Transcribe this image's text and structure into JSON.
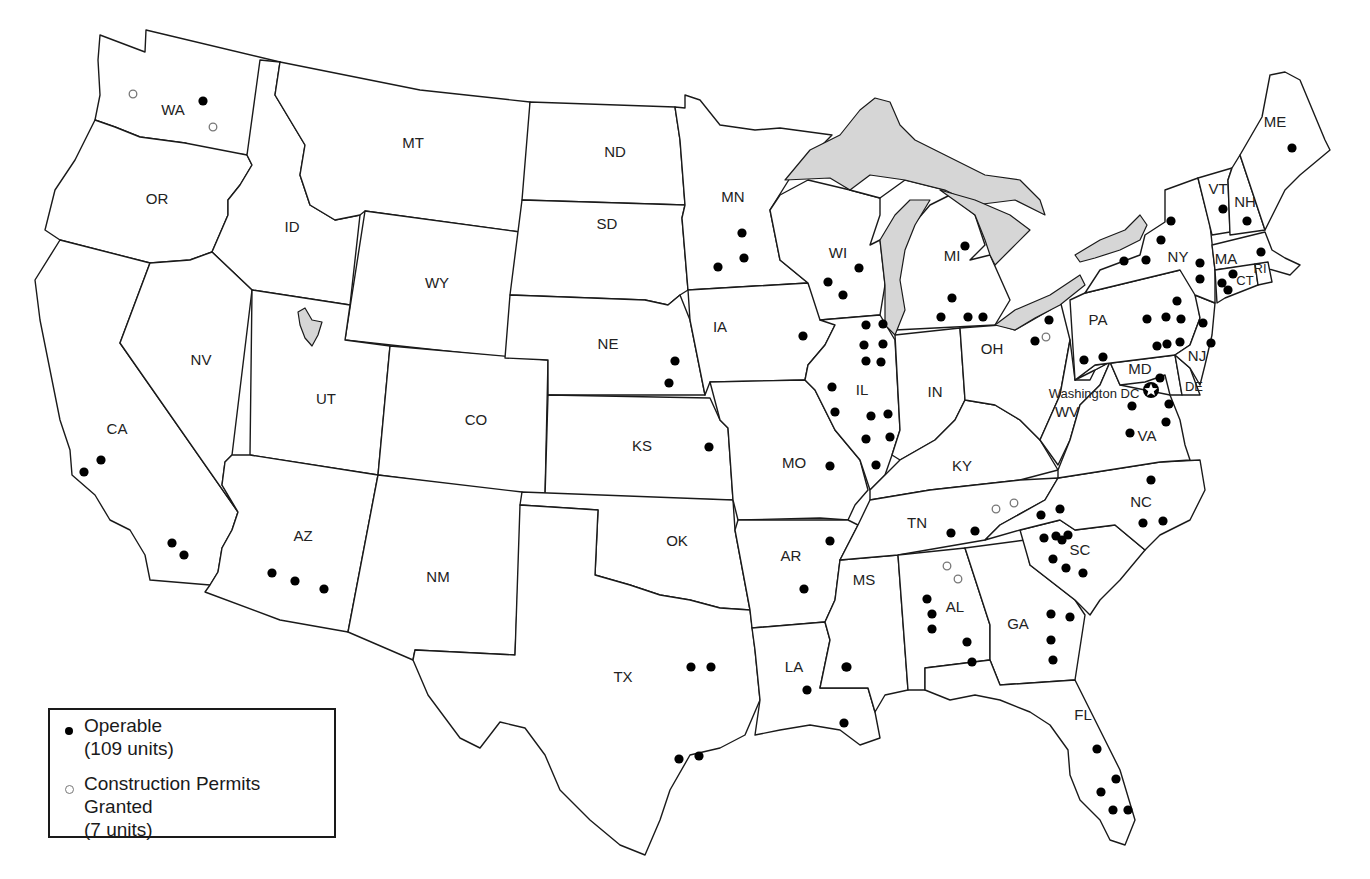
{
  "legend": {
    "operable": {
      "label": "Operable",
      "count": "(109 units)"
    },
    "construction": {
      "label": "Construction Permits Granted",
      "count": "(7 units)"
    }
  },
  "capital": {
    "label": "Washington DC"
  },
  "states": [
    {
      "id": "WA",
      "label": "WA"
    },
    {
      "id": "OR",
      "label": "OR"
    },
    {
      "id": "CA",
      "label": "CA"
    },
    {
      "id": "ID",
      "label": "ID"
    },
    {
      "id": "NV",
      "label": "NV"
    },
    {
      "id": "MT",
      "label": "MT"
    },
    {
      "id": "WY",
      "label": "WY"
    },
    {
      "id": "UT",
      "label": "UT"
    },
    {
      "id": "AZ",
      "label": "AZ"
    },
    {
      "id": "CO",
      "label": "CO"
    },
    {
      "id": "NM",
      "label": "NM"
    },
    {
      "id": "ND",
      "label": "ND"
    },
    {
      "id": "SD",
      "label": "SD"
    },
    {
      "id": "NE",
      "label": "NE"
    },
    {
      "id": "KS",
      "label": "KS"
    },
    {
      "id": "OK",
      "label": "OK"
    },
    {
      "id": "TX",
      "label": "TX"
    },
    {
      "id": "MN",
      "label": "MN"
    },
    {
      "id": "IA",
      "label": "IA"
    },
    {
      "id": "MO",
      "label": "MO"
    },
    {
      "id": "AR",
      "label": "AR"
    },
    {
      "id": "LA",
      "label": "LA"
    },
    {
      "id": "WI",
      "label": "WI"
    },
    {
      "id": "IL",
      "label": "IL"
    },
    {
      "id": "MS",
      "label": "MS"
    },
    {
      "id": "MI",
      "label": "MI"
    },
    {
      "id": "IN",
      "label": "IN"
    },
    {
      "id": "KY",
      "label": "KY"
    },
    {
      "id": "TN",
      "label": "TN"
    },
    {
      "id": "AL",
      "label": "AL"
    },
    {
      "id": "OH",
      "label": "OH"
    },
    {
      "id": "WV",
      "label": "WV"
    },
    {
      "id": "GA",
      "label": "GA"
    },
    {
      "id": "FL",
      "label": "FL"
    },
    {
      "id": "SC",
      "label": "SC"
    },
    {
      "id": "NC",
      "label": "NC"
    },
    {
      "id": "VA",
      "label": "VA"
    },
    {
      "id": "MD",
      "label": "MD"
    },
    {
      "id": "DE",
      "label": "DE"
    },
    {
      "id": "PA",
      "label": "PA"
    },
    {
      "id": "NJ",
      "label": "NJ"
    },
    {
      "id": "NY",
      "label": "NY"
    },
    {
      "id": "CT",
      "label": "CT"
    },
    {
      "id": "RI",
      "label": "RI"
    },
    {
      "id": "MA",
      "label": "MA"
    },
    {
      "id": "VT",
      "label": "VT"
    },
    {
      "id": "NH",
      "label": "NH"
    },
    {
      "id": "ME",
      "label": "ME"
    }
  ],
  "units_by_state": {
    "operable": {
      "WA": 1,
      "CA": 4,
      "AZ": 3,
      "NE": 2,
      "KS": 1,
      "TX": 4,
      "MN": 3,
      "IA": 1,
      "MO": 1,
      "AR": 2,
      "LA": 3,
      "WI": 3,
      "IL": 13,
      "MS": 1,
      "MI": 5,
      "OH": 2,
      "TN": 2,
      "AL": 5,
      "GA": 4,
      "FL": 5,
      "SC": 7,
      "NC": 5,
      "VA": 4,
      "MD": 2,
      "PA": 9,
      "NJ": 3,
      "NY": 6,
      "CT": 3,
      "MA": 1,
      "VT": 1,
      "NH": 1,
      "ME": 1
    },
    "construction_permits": {
      "WA": 2,
      "OH": 1,
      "TN": 2,
      "AL": 2
    }
  }
}
